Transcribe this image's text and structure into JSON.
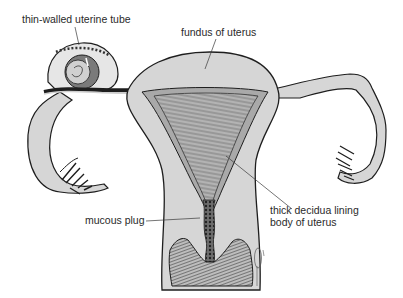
{
  "figure": {
    "colors": {
      "tissue_fill": "#d6d6d6",
      "tissue_light": "#e4e4e4",
      "lining_fill": "#a9a9a9",
      "outline": "#1e1e1e",
      "label_text": "#2a2a2a",
      "leader_line": "#3a3a3a",
      "background": "#ffffff"
    }
  },
  "labels": {
    "tube": "thin-walled uterine tube",
    "fundus": "fundus of uterus",
    "decidua_line1": "thick decidua lining",
    "decidua_line2": "body of uterus",
    "plug": "mucous plug"
  },
  "icons": {
    "signature": "artist-signature-glyph"
  }
}
